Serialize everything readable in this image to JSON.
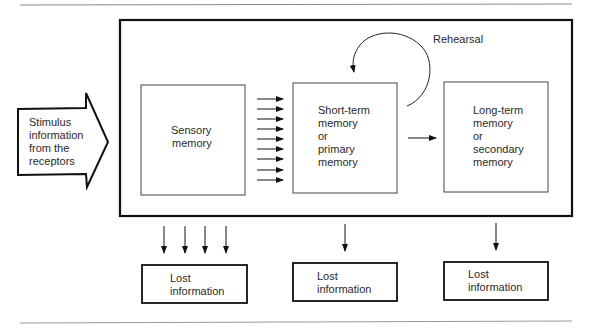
{
  "diagram": {
    "type": "memory-model-flow",
    "stimulus": {
      "label_lines": [
        "Stimulus",
        "information",
        "from the",
        "receptors"
      ]
    },
    "stores": [
      {
        "id": "sensory",
        "label_lines": [
          "Sensory",
          "memory"
        ]
      },
      {
        "id": "short_term",
        "label_lines": [
          "Short-term",
          "memory",
          "or",
          "primary",
          "memory"
        ]
      },
      {
        "id": "long_term",
        "label_lines": [
          "Long-term",
          "memory",
          "or",
          "secondary",
          "memory"
        ]
      }
    ],
    "rehearsal_label": "Rehearsal",
    "lost": [
      {
        "label_lines": [
          "Lost",
          "information"
        ]
      },
      {
        "label_lines": [
          "Lost",
          "information"
        ]
      },
      {
        "label_lines": [
          "Lost",
          "information"
        ]
      }
    ],
    "sensory_to_stm_arrow_count": 9,
    "sensory_lost_arrow_count": 4,
    "colors": {
      "line": "#111111",
      "text": "#2a2a2a",
      "rule": "#888888",
      "background": "#ffffff"
    }
  }
}
